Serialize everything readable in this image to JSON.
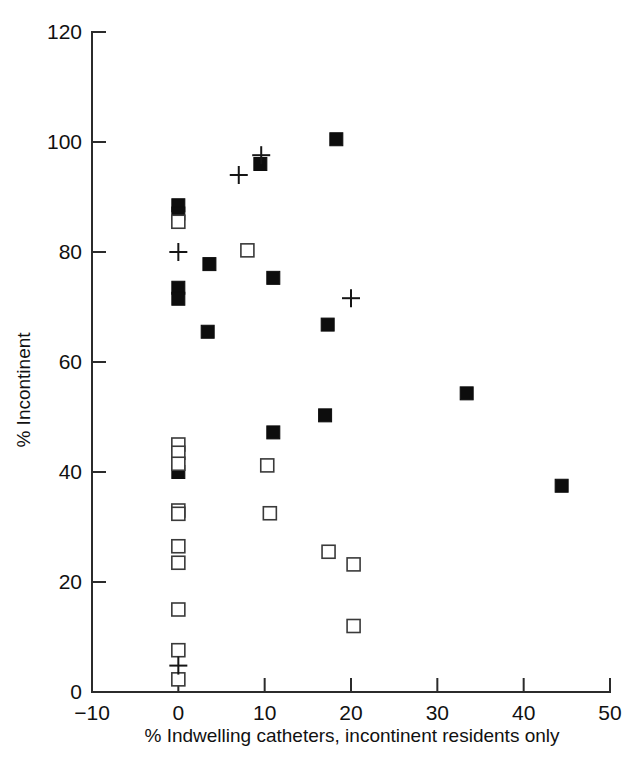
{
  "chart_data": {
    "type": "scatter",
    "title": "",
    "xlabel": "% Indwelling catheters, incontinent residents only",
    "ylabel": "% Incontinent",
    "xlim": [
      -10,
      50
    ],
    "ylim": [
      0,
      120
    ],
    "xticks": [
      -10,
      0,
      10,
      20,
      30,
      40,
      50
    ],
    "xtick_labels": [
      "−10",
      "0",
      "10",
      "20",
      "30",
      "40",
      "50"
    ],
    "yticks": [
      0,
      20,
      40,
      60,
      80,
      100,
      120
    ],
    "ytick_labels": [
      "0",
      "20",
      "40",
      "60",
      "80",
      "100",
      "120"
    ],
    "grid": false,
    "legend": "none",
    "series": [
      {
        "name": "filled-square",
        "marker": "filled square",
        "color": "#0d0d0d",
        "points": [
          {
            "x": 0.0,
            "y": 88.5
          },
          {
            "x": 0.0,
            "y": 87.0
          },
          {
            "x": 0.0,
            "y": 73.5
          },
          {
            "x": 0.0,
            "y": 71.5
          },
          {
            "x": 0.0,
            "y": 40.0
          },
          {
            "x": 3.4,
            "y": 65.5
          },
          {
            "x": 3.6,
            "y": 77.8
          },
          {
            "x": 9.5,
            "y": 96.0
          },
          {
            "x": 11.0,
            "y": 75.3
          },
          {
            "x": 11.0,
            "y": 47.2
          },
          {
            "x": 17.0,
            "y": 50.3
          },
          {
            "x": 17.3,
            "y": 66.8
          },
          {
            "x": 18.3,
            "y": 100.5
          },
          {
            "x": 33.4,
            "y": 54.3
          },
          {
            "x": 44.4,
            "y": 37.5
          }
        ]
      },
      {
        "name": "open-square",
        "marker": "open square",
        "color": "#3a3a3a",
        "points": [
          {
            "x": 0.0,
            "y": 85.5
          },
          {
            "x": 0.0,
            "y": 45.0
          },
          {
            "x": 0.0,
            "y": 43.5
          },
          {
            "x": 0.0,
            "y": 41.5
          },
          {
            "x": 0.0,
            "y": 33.0
          },
          {
            "x": 0.0,
            "y": 32.4
          },
          {
            "x": 0.0,
            "y": 26.5
          },
          {
            "x": 0.0,
            "y": 23.5
          },
          {
            "x": 0.0,
            "y": 15.0
          },
          {
            "x": 0.0,
            "y": 7.6
          },
          {
            "x": 0.0,
            "y": 2.3
          },
          {
            "x": 8.0,
            "y": 80.3
          },
          {
            "x": 10.3,
            "y": 41.2
          },
          {
            "x": 10.6,
            "y": 32.5
          },
          {
            "x": 17.4,
            "y": 25.5
          },
          {
            "x": 20.3,
            "y": 23.2
          },
          {
            "x": 20.3,
            "y": 12.0
          }
        ]
      },
      {
        "name": "plus",
        "marker": "plus",
        "color": "#151515",
        "points": [
          {
            "x": 0.0,
            "y": 80.0
          },
          {
            "x": 0.0,
            "y": 4.8
          },
          {
            "x": 7.0,
            "y": 94.0
          },
          {
            "x": 9.6,
            "y": 97.6
          },
          {
            "x": 20.0,
            "y": 71.6
          }
        ]
      }
    ]
  },
  "figure": {
    "axis_color": "#2b2b2b",
    "background": "#ffffff"
  }
}
